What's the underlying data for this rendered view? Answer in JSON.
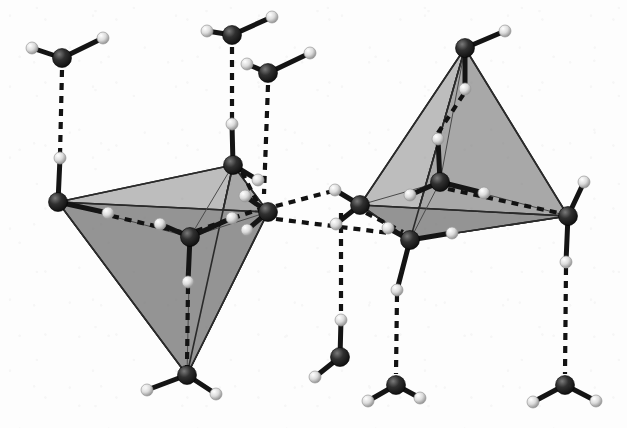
{
  "figure": {
    "kind": "molecular-structure-diagram",
    "background_color": "#fdfdfd",
    "width": 627,
    "height": 428,
    "has_text_labels": false,
    "caption": ""
  },
  "style": {
    "oxygen_color": "#1e1e1e",
    "oxygen_highlight": "#6e6e6e",
    "oxygen_radius": 9.5,
    "hydrogen_color": "#e9e9e9",
    "hydrogen_shade": "#9a9a9a",
    "hydrogen_radius": 6.0,
    "covalent_bond_color": "#141414",
    "covalent_bond_width": 5.0,
    "hbond_color": "#121212",
    "hbond_width": 4.2,
    "hbond_dash": "7 6",
    "face_light": "#bdbdbd",
    "face_mid": "#a8a8a8",
    "face_dark": "#949494",
    "edge_color": "#2a2a2a",
    "edge_width": 1.6,
    "inner_edge_color": "#4a4a4a",
    "inner_edge_width": 1.0
  },
  "legend": {
    "oxygen_label": "O",
    "hydrogen_label": "H",
    "covalent_label": "covalent O–H bond",
    "hbond_label": "hydrogen bond",
    "tetrahedron_label": "coordination tetrahedron"
  },
  "tetrahedra": [
    {
      "name": "left-tetrahedron",
      "orientation": "apex-down",
      "vertices": [
        {
          "id": "L-v-left",
          "x": 58,
          "y": 202
        },
        {
          "id": "L-v-top",
          "x": 233,
          "y": 165
        },
        {
          "id": "L-v-right",
          "x": 268,
          "y": 212
        },
        {
          "id": "L-v-apex",
          "x": 187,
          "y": 375
        }
      ],
      "center": {
        "id": "L-center",
        "x": 190,
        "y": 237
      },
      "faces": [
        {
          "points": "58,202 233,165 187,375",
          "fill": "#bdbdbd"
        },
        {
          "points": "233,165 268,212 187,375",
          "fill": "#a8a8a8"
        },
        {
          "points": "58,202 268,212 187,375",
          "fill": "#949494"
        }
      ]
    },
    {
      "name": "right-tetrahedron",
      "orientation": "apex-up",
      "vertices": [
        {
          "id": "R-v-apex",
          "x": 465,
          "y": 48
        },
        {
          "id": "R-v-left",
          "x": 360,
          "y": 205
        },
        {
          "id": "R-v-bottom",
          "x": 410,
          "y": 240
        },
        {
          "id": "R-v-right",
          "x": 568,
          "y": 216
        }
      ],
      "center": {
        "id": "R-center",
        "x": 440,
        "y": 182
      },
      "faces": [
        {
          "points": "465,48 360,205 410,240",
          "fill": "#bdbdbd"
        },
        {
          "points": "465,48 410,240 568,216",
          "fill": "#a8a8a8"
        },
        {
          "points": "360,205 410,240 568,216",
          "fill": "#949494"
        }
      ]
    }
  ],
  "molecules": [
    {
      "id": "m01",
      "name": "water-top-left-outer",
      "o": {
        "x": 62,
        "y": 58
      },
      "h": [
        {
          "x": 32,
          "y": 48
        },
        {
          "x": 103,
          "y": 38
        }
      ]
    },
    {
      "id": "m02",
      "name": "water-left-vertex",
      "o": {
        "x": 58,
        "y": 202
      },
      "h": [
        {
          "x": 60,
          "y": 158
        },
        {
          "x": 108,
          "y": 213
        }
      ]
    },
    {
      "id": "m03",
      "name": "water-top-center-outer",
      "o": {
        "x": 232,
        "y": 35
      },
      "h": [
        {
          "x": 207,
          "y": 31
        },
        {
          "x": 272,
          "y": 17
        }
      ]
    },
    {
      "id": "m04",
      "name": "water-top-upper-vertex",
      "o": {
        "x": 233,
        "y": 165
      },
      "h": [
        {
          "x": 232,
          "y": 124
        },
        {
          "x": 258,
          "y": 180
        }
      ]
    },
    {
      "id": "m05",
      "name": "water-top-right-outer",
      "o": {
        "x": 268,
        "y": 73
      },
      "h": [
        {
          "x": 247,
          "y": 64
        },
        {
          "x": 310,
          "y": 53
        }
      ]
    },
    {
      "id": "m06",
      "name": "water-left-cluster-center",
      "o": {
        "x": 190,
        "y": 237
      },
      "h": [
        {
          "x": 160,
          "y": 224
        },
        {
          "x": 232,
          "y": 218
        },
        {
          "x": 188,
          "y": 282
        }
      ]
    },
    {
      "id": "m07",
      "name": "water-right-vertex-left",
      "o": {
        "x": 268,
        "y": 212
      },
      "h": [
        {
          "x": 245,
          "y": 196
        },
        {
          "x": 247,
          "y": 230
        }
      ]
    },
    {
      "id": "m08",
      "name": "water-bottom-apex",
      "o": {
        "x": 187,
        "y": 375
      },
      "h": [
        {
          "x": 147,
          "y": 390
        },
        {
          "x": 216,
          "y": 394
        }
      ]
    },
    {
      "id": "m09",
      "name": "water-right-apex-top",
      "o": {
        "x": 465,
        "y": 48
      },
      "h": [
        {
          "x": 505,
          "y": 31
        },
        {
          "x": 465,
          "y": 89
        }
      ]
    },
    {
      "id": "m10",
      "name": "water-right-cluster-center",
      "o": {
        "x": 440,
        "y": 182
      },
      "h": [
        {
          "x": 410,
          "y": 195
        },
        {
          "x": 484,
          "y": 193
        },
        {
          "x": 438,
          "y": 139
        }
      ]
    },
    {
      "id": "m11",
      "name": "water-right-left-vertex",
      "o": {
        "x": 360,
        "y": 205
      },
      "h": [
        {
          "x": 335,
          "y": 190
        },
        {
          "x": 336,
          "y": 224
        }
      ]
    },
    {
      "id": "m12",
      "name": "water-right-bottom-vertex",
      "o": {
        "x": 410,
        "y": 240
      },
      "h": [
        {
          "x": 388,
          "y": 228
        },
        {
          "x": 452,
          "y": 233
        },
        {
          "x": 397,
          "y": 290
        }
      ]
    },
    {
      "id": "m13",
      "name": "water-right-right-vertex",
      "o": {
        "x": 568,
        "y": 216
      },
      "h": [
        {
          "x": 584,
          "y": 182
        },
        {
          "x": 566,
          "y": 262
        }
      ]
    },
    {
      "id": "m14",
      "name": "water-bottom-left-outer",
      "o": {
        "x": 340,
        "y": 357
      },
      "h": [
        {
          "x": 315,
          "y": 377
        },
        {
          "x": 341,
          "y": 320
        }
      ]
    },
    {
      "id": "m15",
      "name": "water-bottom-center-outer",
      "o": {
        "x": 396,
        "y": 385
      },
      "h": [
        {
          "x": 368,
          "y": 401
        },
        {
          "x": 420,
          "y": 398
        }
      ]
    },
    {
      "id": "m16",
      "name": "water-bottom-right-outer",
      "o": {
        "x": 565,
        "y": 385
      },
      "h": [
        {
          "x": 533,
          "y": 402
        },
        {
          "x": 596,
          "y": 401
        }
      ]
    }
  ],
  "hydrogen_bonds": [
    {
      "name": "hb-01",
      "from": {
        "x": 62,
        "y": 70
      },
      "to": {
        "x": 60,
        "y": 155
      }
    },
    {
      "name": "hb-02",
      "from": {
        "x": 232,
        "y": 47
      },
      "to": {
        "x": 232,
        "y": 121
      }
    },
    {
      "name": "hb-03",
      "from": {
        "x": 268,
        "y": 85
      },
      "to": {
        "x": 264,
        "y": 194
      }
    },
    {
      "name": "hb-04",
      "from": {
        "x": 242,
        "y": 172
      },
      "to": {
        "x": 259,
        "y": 206
      }
    },
    {
      "name": "hb-05",
      "from": {
        "x": 112,
        "y": 216
      },
      "to": {
        "x": 181,
        "y": 232
      }
    },
    {
      "name": "hb-06",
      "from": {
        "x": 196,
        "y": 231
      },
      "to": {
        "x": 260,
        "y": 209
      }
    },
    {
      "name": "hb-07",
      "from": {
        "x": 188,
        "y": 287
      },
      "to": {
        "x": 187,
        "y": 366
      }
    },
    {
      "name": "hb-08",
      "from": {
        "x": 276,
        "y": 206
      },
      "to": {
        "x": 333,
        "y": 191
      }
    },
    {
      "name": "hb-09",
      "from": {
        "x": 276,
        "y": 219
      },
      "to": {
        "x": 389,
        "y": 233
      }
    },
    {
      "name": "hb-10",
      "from": {
        "x": 438,
        "y": 133
      },
      "to": {
        "x": 465,
        "y": 92
      }
    },
    {
      "name": "hb-11",
      "from": {
        "x": 448,
        "y": 189
      },
      "to": {
        "x": 559,
        "y": 213
      }
    },
    {
      "name": "hb-12",
      "from": {
        "x": 366,
        "y": 213
      },
      "to": {
        "x": 403,
        "y": 232
      }
    },
    {
      "name": "hb-13",
      "from": {
        "x": 341,
        "y": 213
      },
      "to": {
        "x": 341,
        "y": 314
      }
    },
    {
      "name": "hb-14",
      "from": {
        "x": 397,
        "y": 295
      },
      "to": {
        "x": 396,
        "y": 374
      }
    },
    {
      "name": "hb-15",
      "from": {
        "x": 566,
        "y": 268
      },
      "to": {
        "x": 565,
        "y": 374
      }
    }
  ],
  "inner_connectors": [
    {
      "name": "ic-01",
      "from": {
        "x": 58,
        "y": 202
      },
      "to": {
        "x": 190,
        "y": 237
      }
    },
    {
      "name": "ic-02",
      "from": {
        "x": 233,
        "y": 165
      },
      "to": {
        "x": 190,
        "y": 237
      }
    },
    {
      "name": "ic-03",
      "from": {
        "x": 268,
        "y": 212
      },
      "to": {
        "x": 190,
        "y": 237
      }
    },
    {
      "name": "ic-04",
      "from": {
        "x": 187,
        "y": 375
      },
      "to": {
        "x": 190,
        "y": 237
      }
    },
    {
      "name": "ic-05",
      "from": {
        "x": 465,
        "y": 48
      },
      "to": {
        "x": 440,
        "y": 182
      }
    },
    {
      "name": "ic-06",
      "from": {
        "x": 360,
        "y": 205
      },
      "to": {
        "x": 440,
        "y": 182
      }
    },
    {
      "name": "ic-07",
      "from": {
        "x": 410,
        "y": 240
      },
      "to": {
        "x": 440,
        "y": 182
      }
    },
    {
      "name": "ic-08",
      "from": {
        "x": 568,
        "y": 216
      },
      "to": {
        "x": 440,
        "y": 182
      }
    }
  ]
}
